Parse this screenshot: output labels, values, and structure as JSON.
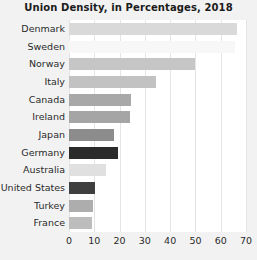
{
  "chart_data": {
    "type": "bar",
    "orientation": "horizontal",
    "title": "Union Density, in Percentages, 2018",
    "xlabel": "",
    "ylabel": "",
    "categories": [
      "Denmark",
      "Sweden",
      "Norway",
      "Italy",
      "Canada",
      "Ireland",
      "Japan",
      "Germany",
      "Australia",
      "United States",
      "Turkey",
      "France"
    ],
    "values": [
      66.5,
      65.5,
      50.0,
      34.4,
      24.5,
      24.1,
      17.8,
      19.4,
      14.6,
      10.3,
      9.5,
      9.0
    ],
    "bar_colors": [
      "#d9d9d9",
      "#f7f7f7",
      "#c6c6c6",
      "#c2c2c2",
      "#a8a8a8",
      "#a5a5a5",
      "#8c8c8c",
      "#2b2b2b",
      "#e0e0e0",
      "#3f3f3f",
      "#adadad",
      "#bdbdbd"
    ],
    "xticks": [
      0,
      10,
      20,
      30,
      40,
      50,
      60,
      70
    ],
    "xticklabels": [
      "0",
      "10",
      "20",
      "30",
      "40",
      "50",
      "60",
      "70"
    ],
    "xlim": [
      0,
      70
    ],
    "grid": true,
    "grid_axis": "x",
    "legend": null,
    "background_color": "#f2f2f2",
    "plot_background_color": "#ffffff",
    "gridline_color": "#e4e4e4",
    "title_color": "#1b1b1b",
    "tick_label_color": "#2a2a2a"
  }
}
